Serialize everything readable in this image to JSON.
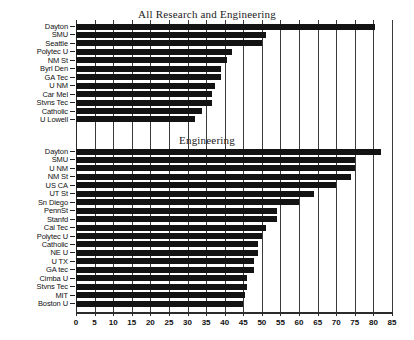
{
  "chart_data": [
    {
      "type": "bar",
      "orientation": "horizontal",
      "title": "All Research and Engineering",
      "xlabel": "",
      "ylabel": "",
      "xlim": [
        0,
        85
      ],
      "xticks": [
        0,
        5,
        10,
        15,
        20,
        25,
        30,
        35,
        40,
        45,
        50,
        55,
        60,
        65,
        70,
        75,
        80,
        85
      ],
      "grid": true,
      "legend": false,
      "categories": [
        "Dayton",
        "SMU",
        "Seattle",
        "Polytec U",
        "NM St",
        "Byrl Den",
        "GA Tec",
        "U NM",
        "Car Mel",
        "Stvns Tec",
        "Catholic",
        "U Lowell"
      ],
      "values": [
        80.5,
        51,
        50,
        42,
        40.5,
        39,
        39,
        37.5,
        36.5,
        36.5,
        34,
        32
      ]
    },
    {
      "type": "bar",
      "orientation": "horizontal",
      "title": "Engineering",
      "xlabel": "",
      "ylabel": "",
      "xlim": [
        0,
        85
      ],
      "xticks": [
        0,
        5,
        10,
        15,
        20,
        25,
        30,
        35,
        40,
        45,
        50,
        55,
        60,
        65,
        70,
        75,
        80,
        85
      ],
      "grid": true,
      "legend": false,
      "categories": [
        "Dayton",
        "SMU",
        "U NM",
        "NM St",
        "US CA",
        "UT St",
        "Sn Diego",
        "PennSt",
        "Stanfd",
        "Cal Tec",
        "Polytec U",
        "Catholic",
        "NE U",
        "U TX",
        "GA tec",
        "Cimba U",
        "Stvns Tec",
        "MIT",
        "Boston U"
      ],
      "values": [
        82,
        75,
        75,
        74,
        70,
        64,
        60,
        54,
        54,
        51,
        50,
        49,
        49,
        48,
        48,
        46,
        46,
        45.5,
        45
      ]
    }
  ],
  "axis": {
    "ticks": [
      "0",
      "5",
      "10",
      "15",
      "20",
      "25",
      "30",
      "35",
      "40",
      "45",
      "50",
      "55",
      "60",
      "65",
      "70",
      "75",
      "80",
      "85"
    ]
  },
  "top": {
    "title": "All Research and Engineering",
    "rows": [
      {
        "label": "Dayton",
        "value": 80.5
      },
      {
        "label": "SMU",
        "value": 51
      },
      {
        "label": "Seattle",
        "value": 50
      },
      {
        "label": "Polytec U",
        "value": 42
      },
      {
        "label": "NM St",
        "value": 40.5
      },
      {
        "label": "Byrl Den",
        "value": 39
      },
      {
        "label": "GA Tec",
        "value": 39
      },
      {
        "label": "U NM",
        "value": 37.5
      },
      {
        "label": "Car Mel",
        "value": 36.5
      },
      {
        "label": "Stvns Tec",
        "value": 36.5
      },
      {
        "label": "Catholic",
        "value": 34
      },
      {
        "label": "U Lowell",
        "value": 32
      }
    ]
  },
  "bottom": {
    "title": "Engineering",
    "rows": [
      {
        "label": "Dayton",
        "value": 82
      },
      {
        "label": "SMU",
        "value": 75
      },
      {
        "label": "U NM",
        "value": 75
      },
      {
        "label": "NM St",
        "value": 74
      },
      {
        "label": "US CA",
        "value": 70
      },
      {
        "label": "UT St",
        "value": 64
      },
      {
        "label": "Sn Diego",
        "value": 60
      },
      {
        "label": "PennSt",
        "value": 54
      },
      {
        "label": "Stanfd",
        "value": 54
      },
      {
        "label": "Cal Tec",
        "value": 51
      },
      {
        "label": "Polytec U",
        "value": 50
      },
      {
        "label": "Catholic",
        "value": 49
      },
      {
        "label": "NE U",
        "value": 49
      },
      {
        "label": "U TX",
        "value": 48
      },
      {
        "label": "GA tec",
        "value": 48
      },
      {
        "label": "Cimba U",
        "value": 46
      },
      {
        "label": "Stvns Tec",
        "value": 46
      },
      {
        "label": "MIT",
        "value": 45.5
      },
      {
        "label": "Boston U",
        "value": 45
      }
    ]
  },
  "colors": {
    "bar": "#131313",
    "grid": "#3a3a3a",
    "text": "#111111",
    "background": "#ffffff"
  }
}
